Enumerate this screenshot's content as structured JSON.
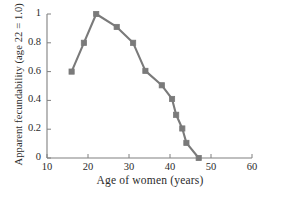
{
  "chart_data": {
    "type": "line",
    "title": "",
    "xlabel": "Age of women (years)",
    "ylabel": "Apparent fecundability (age 22 = 1.0)",
    "xlim": [
      10,
      60
    ],
    "ylim": [
      0,
      1
    ],
    "grid": false,
    "legend": null,
    "xticks": [
      10,
      20,
      30,
      40,
      50,
      60
    ],
    "xtick_labels": [
      "10",
      "20",
      "30",
      "40",
      "50",
      "60"
    ],
    "yticks": [
      0,
      0.2,
      0.4,
      0.6,
      0.8,
      1
    ],
    "ytick_labels": [
      "0",
      "0.2",
      "0.4",
      "0.6",
      "0.8",
      "1"
    ],
    "marker": "square",
    "line_color": "#7a7a7a",
    "marker_color": "#7a7a7a",
    "axis_color": "#808080",
    "x": [
      16,
      19,
      22,
      27,
      31,
      34,
      38,
      40.5,
      41.5,
      43,
      44,
      47
    ],
    "y": [
      0.6,
      0.8,
      1.0,
      0.91,
      0.8,
      0.605,
      0.505,
      0.41,
      0.3,
      0.205,
      0.105,
      0.0
    ],
    "series": [
      {
        "name": "Apparent fecundability",
        "points": [
          {
            "age": 16,
            "value": 0.6
          },
          {
            "age": 19,
            "value": 0.8
          },
          {
            "age": 22,
            "value": 1.0
          },
          {
            "age": 27,
            "value": 0.91
          },
          {
            "age": 31,
            "value": 0.8
          },
          {
            "age": 34,
            "value": 0.605
          },
          {
            "age": 38,
            "value": 0.505
          },
          {
            "age": 40.5,
            "value": 0.41
          },
          {
            "age": 41.5,
            "value": 0.3
          },
          {
            "age": 43,
            "value": 0.205
          },
          {
            "age": 44,
            "value": 0.105
          },
          {
            "age": 47,
            "value": 0.0
          }
        ]
      }
    ]
  }
}
